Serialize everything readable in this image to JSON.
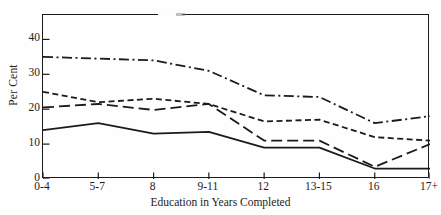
{
  "chart_data": {
    "type": "line",
    "title": "",
    "xlabel": "Education in Years Completed",
    "ylabel": "Per Cent",
    "categories": [
      "0-4",
      "5-7",
      "8",
      "9-11",
      "12",
      "13-15",
      "16",
      "17+"
    ],
    "ylim": [
      0,
      47
    ],
    "yticks": [
      0,
      10,
      20,
      30,
      40
    ],
    "ytick_labels": [
      "0",
      "10",
      "20",
      "30",
      "40"
    ],
    "grid": false,
    "legend": "none",
    "series": [
      {
        "name": "series-dash-dot",
        "style": "dash-dot",
        "color": "#1b1b1b",
        "values": [
          35,
          34.5,
          34,
          31,
          24,
          23.5,
          16,
          18
        ]
      },
      {
        "name": "series-short-dash",
        "style": "short-dash",
        "color": "#1b1b1b",
        "values": [
          25,
          22,
          23,
          21.5,
          16.5,
          17,
          12,
          11
        ]
      },
      {
        "name": "series-long-dash",
        "style": "long-dash",
        "color": "#1b1b1b",
        "values": [
          20.5,
          21.5,
          19.8,
          21.5,
          11,
          11,
          3.5,
          10
        ]
      },
      {
        "name": "series-solid",
        "style": "solid",
        "color": "#1b1b1b",
        "values": [
          14,
          16,
          13,
          13.5,
          9,
          9,
          3,
          3
        ]
      }
    ]
  },
  "axes": {
    "y_title": "Per Cent",
    "x_title": "Education in Years Completed",
    "y_tick_labels": [
      "40",
      "30",
      "20",
      "10",
      "0"
    ],
    "x_tick_labels": [
      "0-4",
      "5-7",
      "8",
      "9-11",
      "12",
      "13-15",
      "16",
      "17+"
    ]
  }
}
